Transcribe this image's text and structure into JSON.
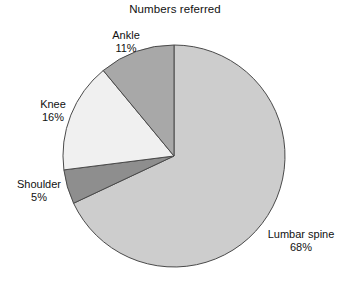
{
  "chart_data": {
    "type": "pie",
    "title": "Numbers referred",
    "xlabel": "",
    "ylabel": "",
    "legend_position": "none",
    "grid": false,
    "start_angle_deg": 0,
    "direction": "clockwise",
    "categories": [
      "Lumbar spine",
      "Shoulder",
      "Knee",
      "Ankle"
    ],
    "values": [
      68,
      5,
      16,
      11
    ],
    "unit": "%",
    "colors": [
      "#cdcdcd",
      "#8e8e8e",
      "#f0f0f0",
      "#a8a8a8"
    ],
    "slices": [
      {
        "label": "Lumbar spine",
        "value": 68,
        "percent_text": "68%",
        "color": "#cdcdcd",
        "start_deg": 0,
        "end_deg": 244.8
      },
      {
        "label": "Shoulder",
        "value": 5,
        "percent_text": "5%",
        "color": "#8e8e8e",
        "start_deg": 244.8,
        "end_deg": 262.8
      },
      {
        "label": "Knee",
        "value": 16,
        "percent_text": "16%",
        "color": "#f0f0f0",
        "start_deg": 262.8,
        "end_deg": 320.4
      },
      {
        "label": "Ankle",
        "value": 11,
        "percent_text": "11%",
        "color": "#a8a8a8",
        "start_deg": 320.4,
        "end_deg": 360
      }
    ],
    "geometry": {
      "center_x": 174,
      "center_y": 156,
      "radius": 111,
      "outline_color": "#4a4a4a"
    }
  },
  "labels": {
    "ankle": {
      "name": "Ankle",
      "pct": "11%"
    },
    "knee": {
      "name": "Knee",
      "pct": "16%"
    },
    "shoulder": {
      "name": "Shoulder",
      "pct": "5%"
    },
    "lumbar": {
      "name": "Lumbar spine",
      "pct": "68%"
    }
  }
}
